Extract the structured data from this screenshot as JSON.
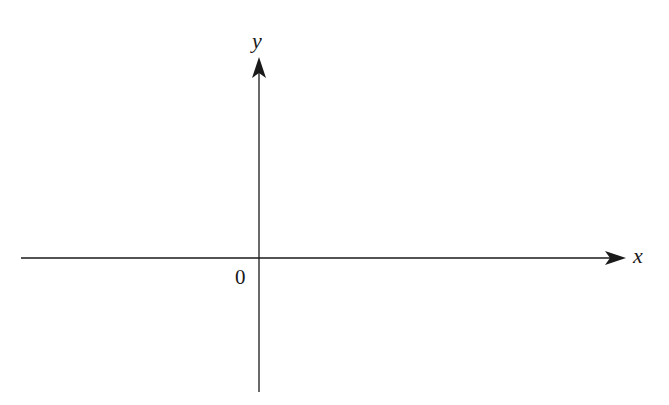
{
  "diagram": {
    "type": "cartesian-axes",
    "x_axis": {
      "label": "x",
      "start": [
        21,
        258
      ],
      "end": [
        626,
        258
      ]
    },
    "y_axis": {
      "label": "y",
      "start": [
        259,
        392
      ],
      "end": [
        259,
        57
      ]
    },
    "origin": {
      "label": "0",
      "position": [
        259,
        258
      ]
    },
    "colors": {
      "stroke": "#1a1a1a",
      "background": "#ffffff"
    }
  }
}
